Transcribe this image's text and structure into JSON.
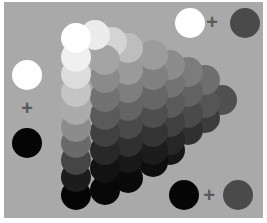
{
  "diagram": {
    "background_color": "#a9a9a9",
    "legends": [
      {
        "name": "tint",
        "left": {
          "color": "#ffffff",
          "x": 190,
          "y": 23,
          "r": 15
        },
        "operator": "+",
        "operator_pos": {
          "x": 204,
          "y": 12
        },
        "right": {
          "color": "#4a4a4a",
          "x": 245,
          "y": 23,
          "r": 15
        }
      },
      {
        "name": "white-black",
        "left": {
          "color": "#ffffff",
          "x": 27,
          "y": 75,
          "r": 15
        },
        "operator": "+",
        "operator_pos": {
          "x": 19,
          "y": 98
        },
        "right": {
          "color": "#050505",
          "x": 27,
          "y": 143,
          "r": 15
        }
      },
      {
        "name": "shade",
        "left": {
          "color": "#050505",
          "x": 184,
          "y": 195,
          "r": 15
        },
        "operator": "+",
        "operator_pos": {
          "x": 201,
          "y": 185
        },
        "right": {
          "color": "#4a4a4a",
          "x": 238,
          "y": 195,
          "r": 15
        }
      }
    ],
    "triangle": {
      "radius": 15,
      "columns": [
        {
          "x": 76,
          "circles": [
            {
              "y": 38,
              "c": "#ffffff"
            },
            {
              "y": 57,
              "c": "#f0f0f0"
            },
            {
              "y": 74,
              "c": "#dcdcdc"
            },
            {
              "y": 92,
              "c": "#c4c4c4"
            },
            {
              "y": 110,
              "c": "#ababab"
            },
            {
              "y": 127,
              "c": "#8c8c8c"
            },
            {
              "y": 143,
              "c": "#6a6a6a"
            },
            {
              "y": 160,
              "c": "#454545"
            },
            {
              "y": 177,
              "c": "#1c1c1c"
            },
            {
              "y": 195,
              "c": "#050505"
            }
          ]
        },
        {
          "x": 95,
          "circles": [
            {
              "y": 35,
              "c": "#ececec"
            }
          ]
        },
        {
          "x": 105,
          "circles": [
            {
              "y": 60,
              "c": "#a4a4a4"
            },
            {
              "y": 78,
              "c": "#8a8a8a"
            },
            {
              "y": 97,
              "c": "#727272"
            },
            {
              "y": 115,
              "c": "#5a5a5a"
            },
            {
              "y": 132,
              "c": "#404040"
            },
            {
              "y": 150,
              "c": "#282828"
            },
            {
              "y": 168,
              "c": "#121212"
            },
            {
              "y": 190,
              "c": "#080808"
            }
          ]
        },
        {
          "x": 112,
          "circles": [
            {
              "y": 42,
              "c": "#d4d4d4"
            }
          ]
        },
        {
          "x": 128,
          "circles": [
            {
              "y": 48,
              "c": "#bdbdbd"
            },
            {
              "y": 70,
              "c": "#9a9a9a"
            },
            {
              "y": 88,
              "c": "#7e7e7e"
            },
            {
              "y": 106,
              "c": "#646464"
            },
            {
              "y": 124,
              "c": "#4a4a4a"
            },
            {
              "y": 142,
              "c": "#303030"
            },
            {
              "y": 158,
              "c": "#181818"
            },
            {
              "y": 178,
              "c": "#0a0a0a"
            }
          ]
        },
        {
          "x": 153,
          "circles": [
            {
              "y": 55,
              "c": "#9c9c9c"
            },
            {
              "y": 75,
              "c": "#808080"
            },
            {
              "y": 95,
              "c": "#666666"
            },
            {
              "y": 113,
              "c": "#4e4e4e"
            },
            {
              "y": 132,
              "c": "#343434"
            },
            {
              "y": 150,
              "c": "#1c1c1c"
            },
            {
              "y": 162,
              "c": "#0e0e0e"
            }
          ]
        },
        {
          "x": 170,
          "circles": [
            {
              "y": 65,
              "c": "#8c8c8c"
            },
            {
              "y": 83,
              "c": "#737373"
            },
            {
              "y": 103,
              "c": "#5a5a5a"
            },
            {
              "y": 122,
              "c": "#404040"
            },
            {
              "y": 140,
              "c": "#262626"
            },
            {
              "y": 150,
              "c": "#161616"
            }
          ]
        },
        {
          "x": 188,
          "circles": [
            {
              "y": 72,
              "c": "#7c7c7c"
            },
            {
              "y": 92,
              "c": "#626262"
            },
            {
              "y": 113,
              "c": "#4a4a4a"
            },
            {
              "y": 130,
              "c": "#303030"
            }
          ]
        },
        {
          "x": 205,
          "circles": [
            {
              "y": 80,
              "c": "#6e6e6e"
            },
            {
              "y": 103,
              "c": "#555555"
            },
            {
              "y": 118,
              "c": "#3c3c3c"
            }
          ]
        },
        {
          "x": 222,
          "circles": [
            {
              "y": 100,
              "c": "#505050"
            }
          ]
        }
      ]
    }
  }
}
